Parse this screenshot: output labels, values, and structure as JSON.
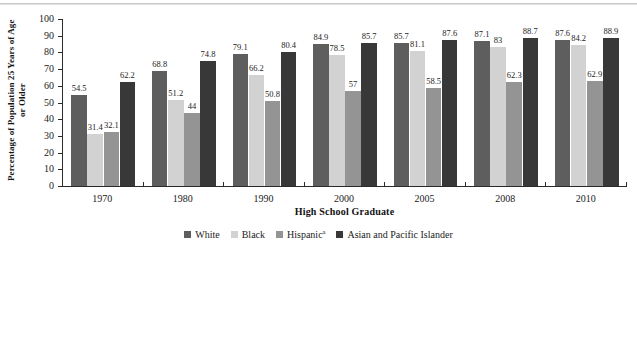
{
  "chart_data": [
    {
      "id": "high-school-graduate",
      "type": "bar",
      "title": "",
      "xlabel": "High School Graduate",
      "ylabel": "Percentage of Population 25 Years of Age or Older",
      "ylim": [
        0,
        100
      ],
      "ytick_labels": [
        "100",
        "90",
        "80",
        "70",
        "60",
        "50",
        "40",
        "30",
        "20",
        "10",
        "0"
      ],
      "ytick_values": [
        100,
        90,
        80,
        70,
        60,
        50,
        40,
        30,
        20,
        10,
        0
      ],
      "categories": [
        "1970",
        "1980",
        "1990",
        "2000",
        "2005",
        "2008",
        "2010"
      ],
      "grid": false,
      "legend_position": "bottom",
      "series": [
        {
          "name": "White",
          "color": "#5e5e5e",
          "values": [
            54.5,
            68.8,
            79.1,
            84.9,
            85.7,
            87.1,
            87.6
          ],
          "labels": [
            "54.5",
            "68.8",
            "79.1",
            "84.9",
            "85.7",
            "87.1",
            "87.6"
          ]
        },
        {
          "name": "Black",
          "color": "#d2d2d2",
          "values": [
            31.4,
            51.2,
            66.2,
            78.5,
            81.1,
            83,
            84.2
          ],
          "labels": [
            "31.4",
            "51.2",
            "66.2",
            "78.5",
            "81.1",
            "83",
            "84.2"
          ]
        },
        {
          "name": "Hispanic",
          "name_sup": "a",
          "color": "#949494",
          "values": [
            32.1,
            44,
            50.8,
            57,
            58.5,
            62.3,
            62.9
          ],
          "labels": [
            "32.1",
            "44",
            "50.8",
            "57",
            "58.5",
            "62.3",
            "62.9"
          ]
        },
        {
          "name": "Asian and Pacific Islander",
          "color": "#383838",
          "values": [
            62.2,
            74.8,
            80.4,
            85.7,
            87.6,
            88.7,
            88.9
          ],
          "labels": [
            "62.2",
            "74.8",
            "80.4",
            "85.7",
            "87.6",
            "88.7",
            "88.9"
          ]
        }
      ]
    },
    {
      "id": "lower-chart-cropped",
      "type": "bar",
      "title": "",
      "xlabel": "",
      "ylabel": "...tion 25 Years ...lder",
      "ylim": [
        0,
        100
      ],
      "ytick_labels": [
        "100",
        "90",
        "80",
        "70",
        "60"
      ],
      "ytick_values": [
        100,
        90,
        80,
        70,
        60
      ],
      "grid": false,
      "note": "Second chart is cut off by the bottom edge of the screenshot; only the top portion is visible.",
      "visible_bars": [
        {
          "label": "83.0",
          "value": 83.0,
          "color": "#d8d8d8"
        }
      ],
      "partial_labels": [
        "52.6",
        "53.4"
      ]
    }
  ],
  "legend": {
    "items": [
      {
        "label": "White",
        "color": "#5e5e5e"
      },
      {
        "label": "Black",
        "color": "#d2d2d2"
      },
      {
        "label": "Hispanic",
        "sup": "a",
        "color": "#949494"
      },
      {
        "label": "Asian and Pacific Islander",
        "color": "#383838"
      }
    ]
  }
}
